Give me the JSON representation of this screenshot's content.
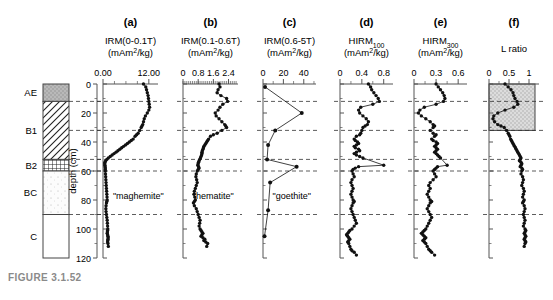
{
  "figure": {
    "caption": "FIGURE 3.1.52",
    "depth_axis_label": "depth (cm)",
    "depth_ticks": [
      0,
      20,
      40,
      60,
      80,
      100,
      120
    ],
    "depth_range": [
      0,
      120
    ],
    "horizon_boundaries": [
      12,
      32,
      52,
      60,
      90
    ]
  },
  "soil_column": {
    "horizons": [
      {
        "label": "AE",
        "top": 0,
        "bottom": 12,
        "pattern": "stipple-gray"
      },
      {
        "label": "B1",
        "top": 12,
        "bottom": 52,
        "pattern": "diagonal-hatch"
      },
      {
        "label": "B2",
        "top": 52,
        "bottom": 60,
        "pattern": "cross-hatch"
      },
      {
        "label": "BC",
        "top": 60,
        "bottom": 90,
        "pattern": "light-dots"
      },
      {
        "label": "C",
        "top": 90,
        "bottom": 120,
        "pattern": "blank"
      }
    ]
  },
  "chart_data": [
    {
      "type": "line",
      "panel": "a",
      "title": "IRM(0-0.1T)",
      "units": "(mAm2/kg)",
      "units_html": "(mAm<tspan baseline-shift=\"super\" font-size=\"7\">2</tspan>/kg)",
      "xlabel": "IRM(0-0.1T) (mAm2/kg)",
      "ylabel": "depth (cm)",
      "xlim": [
        0,
        14.4
      ],
      "ylim": [
        0,
        120
      ],
      "xticks": [
        0,
        12
      ],
      "xtick_labels": [
        "0.00",
        "12.00"
      ],
      "xminor": [
        3,
        6,
        9
      ],
      "annotation": "\"maghemite\"",
      "markers": true,
      "x": [
        10.6,
        11.2,
        11.4,
        11.6,
        11.8,
        11.9,
        12.0,
        12.1,
        12.2,
        12.0,
        11.6,
        11.1,
        10.8,
        10.6,
        10.4,
        10.2,
        10.0,
        9.6,
        9.2,
        8.8,
        8.4,
        7.9,
        7.4,
        6.9,
        6.4,
        5.9,
        5.4,
        4.9,
        4.4,
        3.9,
        3.4,
        2.9,
        2.4,
        1.9,
        1.4,
        1.0,
        0.7,
        0.5,
        0.45,
        0.5,
        0.55,
        0.6,
        0.6,
        0.6,
        0.65,
        0.7,
        0.75,
        0.8,
        0.85,
        0.9,
        0.95,
        1.0,
        1.05,
        1.1,
        1.0,
        0.9,
        0.8,
        0.75,
        0.8,
        0.9,
        1.0,
        1.1,
        1.15,
        1.2,
        1.25,
        1.2,
        1.15,
        1.1,
        1.2,
        1.3,
        1.35,
        1.3,
        1.25,
        1.2,
        1.3,
        1.4
      ],
      "y": [
        0,
        2,
        4,
        6,
        8,
        10,
        12,
        14,
        16,
        18,
        20,
        22,
        24,
        26,
        28,
        29,
        30,
        32,
        34,
        35,
        36,
        38,
        39,
        40,
        41,
        42,
        43,
        44,
        45,
        46,
        47,
        48,
        49,
        50,
        51,
        52,
        53,
        54,
        55,
        56,
        57,
        58,
        59,
        60,
        62,
        64,
        66,
        68,
        70,
        72,
        74,
        76,
        78,
        80,
        81,
        82,
        84,
        86,
        88,
        90,
        92,
        94,
        96,
        98,
        100,
        101,
        102,
        103,
        104,
        105,
        106,
        107,
        108,
        109,
        110,
        112
      ]
    },
    {
      "type": "line",
      "panel": "b",
      "title": "IRM(0.1-0.6T)",
      "units": "(mAm2/kg)",
      "xlabel": "IRM(0.1-0.6T) (mAm2/kg)",
      "ylabel": "depth (cm)",
      "xlim": [
        0,
        2.9
      ],
      "ylim": [
        0,
        120
      ],
      "xticks": [
        0,
        0.8,
        1.6,
        2.4
      ],
      "xtick_labels": [
        "0",
        "0.8",
        "1.6",
        "2.4"
      ],
      "annotation": "\"hematite\"",
      "markers": true,
      "x": [
        1.9,
        1.95,
        1.85,
        1.8,
        2.0,
        2.3,
        2.35,
        2.1,
        1.95,
        1.85,
        1.7,
        1.75,
        1.9,
        2.05,
        2.2,
        2.25,
        2.3,
        2.05,
        1.8,
        1.6,
        1.45,
        1.35,
        1.3,
        1.25,
        1.2,
        1.15,
        1.1,
        1.08,
        1.05,
        1.02,
        1.0,
        1.0,
        0.98,
        0.95,
        0.92,
        0.88,
        0.85,
        0.82,
        0.8,
        0.78,
        0.82,
        0.85,
        0.8,
        0.75,
        0.7,
        0.68,
        0.72,
        0.75,
        0.7,
        0.65,
        0.6,
        0.58,
        0.62,
        0.65,
        0.6,
        0.55,
        0.6,
        0.7,
        0.75,
        0.8,
        0.85,
        0.9,
        0.88,
        0.85,
        0.9,
        0.95,
        1.0,
        1.05,
        1.0,
        0.95,
        1.05,
        1.15,
        1.1,
        1.2,
        1.3,
        1.25
      ],
      "y": [
        0,
        2,
        4,
        6,
        8,
        10,
        12,
        14,
        16,
        18,
        20,
        22,
        24,
        26,
        28,
        29,
        30,
        32,
        34,
        35,
        36,
        38,
        39,
        40,
        41,
        42,
        43,
        44,
        45,
        46,
        47,
        48,
        49,
        50,
        51,
        52,
        53,
        54,
        55,
        56,
        57,
        58,
        59,
        60,
        62,
        64,
        66,
        68,
        70,
        72,
        74,
        76,
        78,
        80,
        81,
        82,
        84,
        86,
        88,
        90,
        92,
        94,
        96,
        98,
        100,
        101,
        102,
        103,
        104,
        105,
        106,
        107,
        108,
        109,
        110,
        112
      ]
    },
    {
      "type": "line",
      "panel": "c",
      "title": "IRM(0.6-5T)",
      "units": "(mAm2/kg)",
      "xlabel": "IRM(0.6-5T) (mAm2/kg)",
      "ylabel": "depth (cm)",
      "xlim": [
        0,
        52
      ],
      "ylim": [
        0,
        120
      ],
      "xticks": [
        0,
        20,
        40
      ],
      "xtick_labels": [
        "0",
        "20",
        "40"
      ],
      "xminor": [
        10,
        30,
        50
      ],
      "annotation": "\"goethite\"",
      "markers": true,
      "x": [
        2.0,
        38.0,
        12.0,
        5.0,
        4.0,
        33.0,
        7.0,
        5.0,
        1.5
      ],
      "y": [
        2,
        20,
        32,
        42,
        52,
        57,
        68,
        87,
        105
      ]
    },
    {
      "type": "line",
      "panel": "d",
      "title": "HIRM100",
      "title_sub": "100",
      "units": "(mAm2/kg)",
      "xlabel": "HIRM100 (mAm2/kg)",
      "ylabel": "depth (cm)",
      "xlim": [
        0,
        0.97
      ],
      "ylim": [
        0,
        120
      ],
      "xticks": [
        0,
        0.4,
        0.8
      ],
      "xtick_labels": [
        "0",
        "0.4",
        "0.8"
      ],
      "xminor": [
        0.2,
        0.6
      ],
      "markers": true,
      "x": [
        0.52,
        0.56,
        0.58,
        0.62,
        0.66,
        0.7,
        0.72,
        0.6,
        0.38,
        0.34,
        0.36,
        0.42,
        0.48,
        0.52,
        0.5,
        0.46,
        0.42,
        0.4,
        0.38,
        0.36,
        0.3,
        0.26,
        0.28,
        0.32,
        0.34,
        0.3,
        0.26,
        0.28,
        0.34,
        0.36,
        0.3,
        0.26,
        0.3,
        0.36,
        0.42,
        0.8,
        0.34,
        0.28,
        0.24,
        0.22,
        0.24,
        0.26,
        0.22,
        0.2,
        0.22,
        0.24,
        0.22,
        0.2,
        0.22,
        0.24,
        0.26,
        0.24,
        0.22,
        0.2,
        0.22,
        0.24,
        0.26,
        0.28,
        0.3,
        0.26,
        0.22,
        0.18,
        0.16,
        0.14,
        0.12,
        0.14,
        0.16,
        0.18,
        0.16,
        0.14,
        0.16,
        0.18,
        0.2,
        0.22,
        0.26,
        0.3
      ],
      "y": [
        0,
        2,
        4,
        6,
        8,
        10,
        12,
        14,
        16,
        18,
        20,
        22,
        24,
        26,
        28,
        29,
        30,
        32,
        34,
        35,
        36,
        38,
        39,
        40,
        41,
        42,
        43,
        44,
        45,
        46,
        47,
        48,
        49,
        50,
        51,
        56,
        57,
        58,
        59,
        60,
        62,
        64,
        66,
        68,
        70,
        72,
        74,
        76,
        78,
        80,
        81,
        82,
        84,
        86,
        88,
        90,
        92,
        94,
        96,
        98,
        100,
        101,
        102,
        103,
        104,
        105,
        106,
        107,
        108,
        109,
        110,
        112,
        114,
        115,
        116,
        118
      ]
    },
    {
      "type": "line",
      "panel": "e",
      "title": "HIRM300",
      "title_sub": "300",
      "units": "(mAm2/kg)",
      "xlabel": "HIRM300 (mAm2/kg)",
      "ylabel": "depth (cm)",
      "xlim": [
        0,
        0.72
      ],
      "ylim": [
        0,
        120
      ],
      "xticks": [
        0,
        0.3,
        0.6
      ],
      "xtick_labels": [
        "0",
        "0.3",
        "0.6"
      ],
      "xminor": [
        0.15,
        0.45
      ],
      "markers": true,
      "x": [
        0.3,
        0.33,
        0.36,
        0.39,
        0.41,
        0.42,
        0.4,
        0.3,
        0.14,
        0.08,
        0.06,
        0.1,
        0.16,
        0.22,
        0.26,
        0.28,
        0.26,
        0.22,
        0.26,
        0.3,
        0.28,
        0.24,
        0.26,
        0.3,
        0.32,
        0.3,
        0.28,
        0.3,
        0.32,
        0.3,
        0.28,
        0.3,
        0.32,
        0.34,
        0.36,
        0.45,
        0.32,
        0.3,
        0.28,
        0.26,
        0.28,
        0.3,
        0.26,
        0.22,
        0.2,
        0.22,
        0.2,
        0.18,
        0.2,
        0.22,
        0.24,
        0.22,
        0.2,
        0.18,
        0.2,
        0.22,
        0.24,
        0.22,
        0.2,
        0.18,
        0.16,
        0.14,
        0.12,
        0.1,
        0.12,
        0.14,
        0.16,
        0.14,
        0.12,
        0.14,
        0.16,
        0.18,
        0.2,
        0.22,
        0.24,
        0.28
      ],
      "y": [
        0,
        2,
        4,
        6,
        8,
        10,
        12,
        14,
        16,
        18,
        20,
        22,
        24,
        26,
        28,
        29,
        30,
        32,
        34,
        35,
        36,
        38,
        39,
        40,
        41,
        42,
        43,
        44,
        45,
        46,
        47,
        48,
        49,
        50,
        51,
        56,
        57,
        58,
        59,
        60,
        62,
        64,
        66,
        68,
        70,
        72,
        74,
        76,
        78,
        80,
        81,
        82,
        84,
        86,
        88,
        90,
        92,
        94,
        96,
        98,
        100,
        101,
        102,
        103,
        104,
        105,
        106,
        107,
        108,
        109,
        110,
        112,
        114,
        115,
        116,
        118
      ]
    },
    {
      "type": "line",
      "panel": "f",
      "title": "L ratio",
      "units": "",
      "xlabel": "L ratio",
      "ylabel": "depth (cm)",
      "xlim": [
        0,
        1.25
      ],
      "ylim": [
        0,
        120
      ],
      "xticks": [
        0,
        0.5,
        1
      ],
      "xtick_labels": [
        "0",
        "0.5",
        "1"
      ],
      "xminor": [
        0.25,
        0.75
      ],
      "shaded_box": {
        "x0": 0,
        "x1": 1.15,
        "y0": 0,
        "y1": 32,
        "fill": "#d5d5d5"
      },
      "markers": true,
      "x": [
        0.4,
        0.48,
        0.55,
        0.6,
        0.62,
        0.65,
        0.7,
        0.72,
        0.62,
        0.4,
        0.22,
        0.12,
        0.1,
        0.14,
        0.22,
        0.3,
        0.38,
        0.44,
        0.48,
        0.5,
        0.52,
        0.54,
        0.56,
        0.58,
        0.6,
        0.62,
        0.64,
        0.66,
        0.68,
        0.7,
        0.72,
        0.74,
        0.76,
        0.78,
        0.8,
        0.78,
        0.76,
        0.8,
        0.82,
        0.8,
        0.78,
        0.82,
        0.84,
        0.82,
        0.8,
        0.84,
        0.86,
        0.84,
        0.82,
        0.86,
        0.88,
        0.86,
        0.84,
        0.88,
        0.86,
        0.84,
        0.88,
        0.9,
        0.88,
        0.86,
        0.88,
        0.9,
        0.88,
        0.86,
        0.9,
        0.92,
        0.9,
        0.88,
        0.9,
        0.92,
        0.9,
        0.88,
        0.9,
        0.92,
        0.9,
        0.88
      ],
      "y": [
        0,
        2,
        4,
        6,
        8,
        10,
        12,
        14,
        16,
        18,
        20,
        22,
        24,
        26,
        28,
        29,
        30,
        32,
        34,
        35,
        36,
        38,
        39,
        40,
        41,
        42,
        43,
        44,
        45,
        46,
        47,
        48,
        49,
        50,
        51,
        52,
        53,
        54,
        55,
        56,
        57,
        58,
        59,
        60,
        62,
        64,
        66,
        68,
        70,
        72,
        74,
        76,
        78,
        80,
        81,
        82,
        84,
        86,
        88,
        90,
        92,
        94,
        96,
        98,
        100,
        101,
        102,
        103,
        104,
        105,
        106,
        107,
        108,
        109,
        110,
        112
      ]
    }
  ]
}
